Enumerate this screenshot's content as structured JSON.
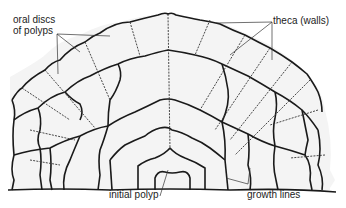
{
  "diagram": {
    "colors": {
      "background": "#ffffff",
      "fill": "#f4f4f4",
      "ink": "#1a1a1a"
    },
    "labels": {
      "oral_discs": [
        "oral discs",
        "of polyps"
      ],
      "theca": "theca (walls)",
      "initial_polyp": "initial polyp",
      "growth_lines": "growth lines"
    }
  }
}
